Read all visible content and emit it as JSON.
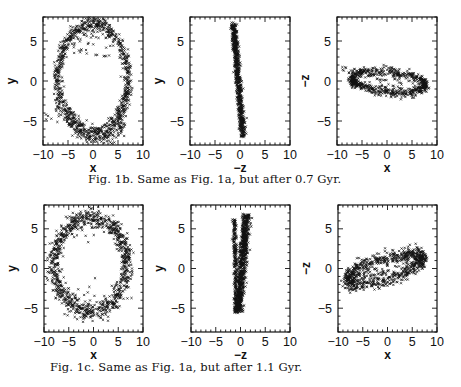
{
  "figures": [
    {
      "id": "1b",
      "caption": "Fig. 1b. Same as Fig. 1a, but after 0.7 Gyr.",
      "panels": [
        {
          "xlabel": "x",
          "ylabel": "y",
          "shape": {
            "type": "ring",
            "cx": 0.0,
            "cy": 0.3,
            "rx": 7.0,
            "ry": 6.8,
            "rot": -8,
            "width": 0.45,
            "n": 900,
            "extra": [
              {
                "type": "arc",
                "cx": 1.5,
                "cy": -2.5,
                "rx": 6.0,
                "ry": 4.8,
                "a0": 190,
                "a1": 320,
                "width": 0.4,
                "n": 120
              },
              {
                "type": "scatter",
                "x0": -9.5,
                "x1": -6,
                "y0": -5.5,
                "y1": -3,
                "n": 12
              },
              {
                "type": "scatter",
                "x0": -4,
                "x1": 4,
                "y0": 3,
                "y1": 6.5,
                "n": 40
              }
            ]
          }
        },
        {
          "xlabel": "−z",
          "ylabel": "y",
          "shape": {
            "type": "band",
            "x_top": -1.3,
            "x_bot": 0.6,
            "y_top": 7.2,
            "y_bot": -7.0,
            "width": 0.55,
            "n": 700
          }
        },
        {
          "xlabel": "x",
          "ylabel": "−z",
          "shape": {
            "type": "ring",
            "cx": 0.3,
            "cy": -0.1,
            "rx": 7.4,
            "ry": 1.25,
            "rot": -3,
            "width": 0.3,
            "n": 700,
            "extra": [
              {
                "type": "scatter",
                "x0": -4,
                "x1": 3,
                "y0": -0.8,
                "y1": 0.8,
                "n": 30
              },
              {
                "type": "scatter",
                "x0": -9,
                "x1": -7.5,
                "y0": 1.0,
                "y1": 2.0,
                "n": 5
              }
            ]
          }
        }
      ]
    },
    {
      "id": "1c",
      "caption": "Fig. 1c. Same as Fig. 1a, but after 1.1 Gyr.",
      "panels": [
        {
          "xlabel": "x",
          "ylabel": "y",
          "shape": {
            "type": "ring",
            "cx": -0.6,
            "cy": 0.5,
            "rx": 7.3,
            "ry": 5.9,
            "rot": 0,
            "width": 0.6,
            "n": 1000,
            "extra": [
              {
                "type": "scatter",
                "x0": -4,
                "x1": 4,
                "y0": -6.8,
                "y1": 6.5,
                "n": 15
              }
            ]
          }
        },
        {
          "xlabel": "−z",
          "ylabel": "y",
          "shape": {
            "type": "band",
            "x_top": 1.2,
            "x_bot": -0.4,
            "y_top": 6.8,
            "y_bot": -5.5,
            "width": 0.8,
            "n": 800,
            "extra": [
              {
                "type": "band",
                "x_top": -1.2,
                "x_bot": -0.9,
                "y_top": 6.2,
                "y_bot": -5.6,
                "width": 0.4,
                "n": 250
              }
            ]
          }
        },
        {
          "xlabel": "x",
          "ylabel": "−z",
          "shape": {
            "type": "ring",
            "cx": -0.5,
            "cy": -0.1,
            "rx": 7.6,
            "ry": 1.3,
            "rot": 10,
            "width": 0.5,
            "n": 800,
            "extra": [
              {
                "type": "scatter",
                "x0": -5,
                "x1": 4,
                "y0": -1.2,
                "y1": 1.2,
                "n": 50
              }
            ]
          }
        }
      ]
    }
  ],
  "axes": {
    "x_ticks": [
      -10,
      -5,
      0,
      5,
      10
    ],
    "x_tick_labels": [
      "−10",
      "−5",
      "0",
      "5",
      "10"
    ],
    "y_ticks": [
      -5,
      0,
      5
    ],
    "y_tick_labels": [
      "−5",
      "0",
      "5"
    ],
    "xlim": [
      -10,
      10
    ],
    "ylim": [
      -8,
      8
    ]
  },
  "colors": {
    "ink": "#111111",
    "background": "#ffffff"
  }
}
